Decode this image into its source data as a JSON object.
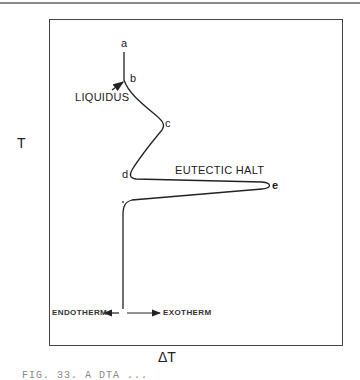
{
  "figure": {
    "y_axis_label": "T",
    "x_axis_label": "ΔT",
    "points": {
      "a": "a",
      "b": "b",
      "c": "c",
      "d": "d",
      "e": "e"
    },
    "annotations": {
      "liquidus": "LIQUIDUS",
      "eutectic_halt": "EUTECTIC HALT"
    },
    "direction_labels": {
      "endotherm": "ENDOTHERM",
      "exotherm": "EXOTHERM"
    },
    "caption": "FIG. 33.  A DTA ..."
  }
}
